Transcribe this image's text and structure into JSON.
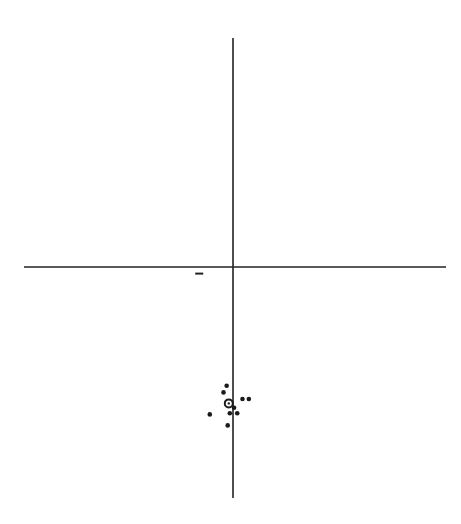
{
  "chart_data": {
    "type": "scatter",
    "title": "",
    "xlabel": "",
    "ylabel": "",
    "xlim": [
      -10,
      10
    ],
    "ylim": [
      -10,
      10
    ],
    "grid": false,
    "legend": "none",
    "axes_color": "#222222",
    "point_color": "#1a1a1a",
    "series": [
      {
        "name": "impacts",
        "points": [
          {
            "x": -0.3,
            "y": -5.4
          },
          {
            "x": -0.45,
            "y": -5.7
          },
          {
            "x": 0.05,
            "y": -6.4
          },
          {
            "x": 0.45,
            "y": -6.0
          },
          {
            "x": 0.75,
            "y": -6.0
          },
          {
            "x": -1.1,
            "y": -6.7
          },
          {
            "x": -0.15,
            "y": -6.65
          },
          {
            "x": 0.2,
            "y": -6.65
          },
          {
            "x": -0.25,
            "y": -7.2
          }
        ]
      },
      {
        "name": "group-center",
        "marker": "ring",
        "points": [
          {
            "x": -0.2,
            "y": -6.2
          }
        ]
      }
    ],
    "annotations": [
      {
        "kind": "short-dash",
        "x": -1.6,
        "y": -0.3
      }
    ]
  }
}
